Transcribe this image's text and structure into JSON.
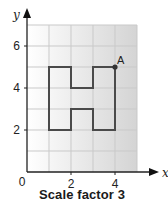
{
  "caption": "Scale factor 3",
  "axes": {
    "x_label": "x",
    "y_label": "y",
    "origin_label": "0",
    "x_ticks": [
      {
        "value": 2,
        "label": "2"
      },
      {
        "value": 4,
        "label": "4"
      }
    ],
    "y_ticks": [
      {
        "value": 2,
        "label": "2"
      },
      {
        "value": 4,
        "label": "4"
      },
      {
        "value": 6,
        "label": "6"
      }
    ],
    "x_range": [
      0,
      5
    ],
    "y_range": [
      0,
      7
    ]
  },
  "grid": {
    "visible": true,
    "step": 1,
    "line_color": "#c9c9c9",
    "bg_gradient_from": "#ffffff",
    "bg_gradient_to": "#d4d4d4"
  },
  "shape": {
    "name": "H shape",
    "stroke_color": "#4a4a4a",
    "vertices": [
      [
        1,
        5
      ],
      [
        2,
        5
      ],
      [
        2,
        4
      ],
      [
        3,
        4
      ],
      [
        3,
        5
      ],
      [
        4,
        5
      ],
      [
        4,
        2
      ],
      [
        3,
        2
      ],
      [
        3,
        3
      ],
      [
        2,
        3
      ],
      [
        2,
        2
      ],
      [
        1,
        2
      ]
    ]
  },
  "points": [
    {
      "label": "A",
      "x": 4,
      "y": 5,
      "color": "#333333"
    }
  ],
  "chart_data": {
    "type": "diagram",
    "title": "Scale factor 3",
    "xlabel": "x",
    "ylabel": "y",
    "xlim": [
      0,
      5
    ],
    "ylim": [
      0,
      7
    ],
    "x_tick_labels": [
      "2",
      "4"
    ],
    "y_tick_labels": [
      "2",
      "4",
      "6"
    ],
    "grid": true,
    "polygon": [
      [
        1,
        5
      ],
      [
        2,
        5
      ],
      [
        2,
        4
      ],
      [
        3,
        4
      ],
      [
        3,
        5
      ],
      [
        4,
        5
      ],
      [
        4,
        2
      ],
      [
        3,
        2
      ],
      [
        3,
        3
      ],
      [
        2,
        3
      ],
      [
        2,
        2
      ],
      [
        1,
        2
      ]
    ],
    "labeled_points": [
      {
        "label": "A",
        "x": 4,
        "y": 5
      }
    ]
  }
}
